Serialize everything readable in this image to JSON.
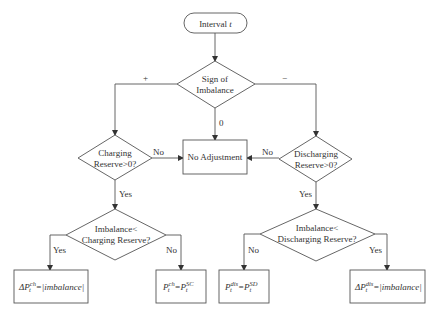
{
  "nodes": {
    "start": {
      "label": "Interval ",
      "var": "t"
    },
    "sign": {
      "line1": "Sign of",
      "line2": "Imbalance"
    },
    "charging_reserve": {
      "line1": "Charging",
      "line2": "Reserve>0?"
    },
    "no_adjustment": {
      "label": "No Adjustment"
    },
    "discharging_reserve": {
      "line1": "Discharging",
      "line2": "Reserve>0?"
    },
    "imb_lt_charging": {
      "line1": "Imbalance<",
      "line2": "Charging Reserve?"
    },
    "imb_lt_discharging": {
      "line1": "Imbalance<",
      "line2": "Discharging Reserve?"
    },
    "delta_ch": {
      "delta": "ΔP",
      "sup": "ch",
      "sub": "t",
      "rhs": "=|imbalance|"
    },
    "p_ch": {
      "p": "P",
      "sup": "ch",
      "sub": "t",
      "eq": "=",
      "p2": "P",
      "sup2": "SC",
      "sub2": "t"
    },
    "p_dis": {
      "p": "P",
      "sup": "dis",
      "sub": "t",
      "eq": "=",
      "p2": "P",
      "sup2": "SD",
      "sub2": "t"
    },
    "delta_dis": {
      "delta": "ΔP",
      "sup": "dis",
      "sub": "t",
      "rhs": "=|imbalance|"
    }
  },
  "edges": {
    "plus": "+",
    "minus": "−",
    "zero": "0",
    "charging_no": "No",
    "charging_yes": "Yes",
    "discharging_no": "No",
    "discharging_yes": "Yes",
    "imb_ch_yes": "Yes",
    "imb_ch_no": "No",
    "imb_dis_no": "No",
    "imb_dis_yes": "Yes"
  }
}
